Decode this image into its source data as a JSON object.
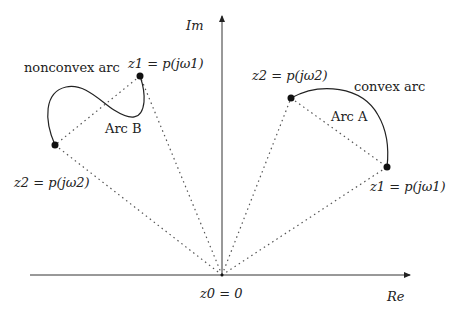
{
  "diagram": {
    "axes": {
      "imag_label": "Im",
      "real_label": "Re",
      "origin_label": "z0 = 0",
      "origin": [
        222,
        275
      ]
    },
    "arc_a": {
      "name": "Arc A",
      "annotation": "convex arc",
      "z1_label": "z1 = p(jω1)",
      "z2_label": "z2 = p(jω2)",
      "z1": [
        387,
        167
      ],
      "z2": [
        291,
        98
      ]
    },
    "arc_b": {
      "name": "Arc B",
      "annotation": "nonconvex arc",
      "z1_label": "z1 = p(jω1)",
      "z2_label": "z2 = p(jω2)",
      "z1": [
        140,
        76
      ],
      "z2": [
        55,
        145
      ]
    },
    "colors": {
      "stroke": "#222222",
      "dotted": "#555555"
    }
  }
}
